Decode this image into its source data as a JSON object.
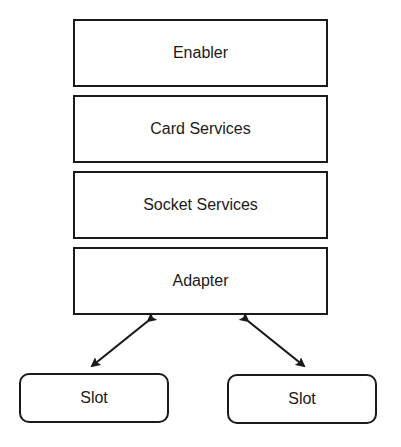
{
  "diagram": {
    "layers": [
      {
        "label": "Enabler"
      },
      {
        "label": "Card Services"
      },
      {
        "label": "Socket Services"
      },
      {
        "label": "Adapter"
      }
    ],
    "slots": [
      {
        "label": "Slot"
      },
      {
        "label": "Slot"
      }
    ],
    "connections": [
      {
        "from": "Adapter",
        "to": "Slot (left)",
        "type": "bidirectional"
      },
      {
        "from": "Adapter",
        "to": "Slot (right)",
        "type": "bidirectional"
      }
    ],
    "colors": {
      "stroke": "#1a1a1a",
      "background": "#ffffff"
    }
  }
}
